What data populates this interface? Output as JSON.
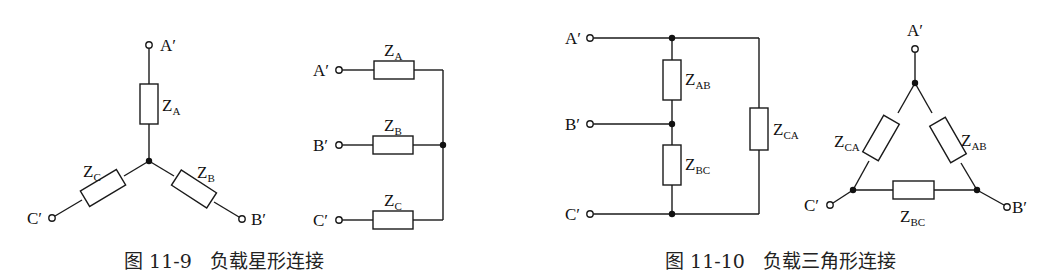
{
  "figures": [
    {
      "id": "fig-11-9",
      "caption_number": "图 11-9",
      "caption_text": "负载星形连接",
      "star": {
        "terminals": [
          "A′",
          "B′",
          "C′"
        ],
        "impedances": [
          {
            "main": "Z",
            "sub": "A"
          },
          {
            "main": "Z",
            "sub": "B"
          },
          {
            "main": "Z",
            "sub": "C"
          }
        ]
      },
      "equivalent": {
        "terminals": [
          "A′",
          "B′",
          "C′"
        ],
        "impedances": [
          {
            "main": "Z",
            "sub": "A"
          },
          {
            "main": "Z",
            "sub": "B"
          },
          {
            "main": "Z",
            "sub": "C"
          }
        ]
      }
    },
    {
      "id": "fig-11-10",
      "caption_number": "图 11-10",
      "caption_text": "负载三角形连接",
      "ladder": {
        "terminals": [
          "A′",
          "B′",
          "C′"
        ],
        "impedances": [
          {
            "main": "Z",
            "sub": "AB"
          },
          {
            "main": "Z",
            "sub": "BC"
          },
          {
            "main": "Z",
            "sub": "CA"
          }
        ]
      },
      "delta": {
        "terminals": [
          "A′",
          "B′",
          "C′"
        ],
        "impedances": [
          {
            "main": "Z",
            "sub": "CA"
          },
          {
            "main": "Z",
            "sub": "AB"
          },
          {
            "main": "Z",
            "sub": "BC"
          }
        ]
      }
    }
  ],
  "colors": {
    "line": "#1a1a1a",
    "background": "#ffffff"
  }
}
